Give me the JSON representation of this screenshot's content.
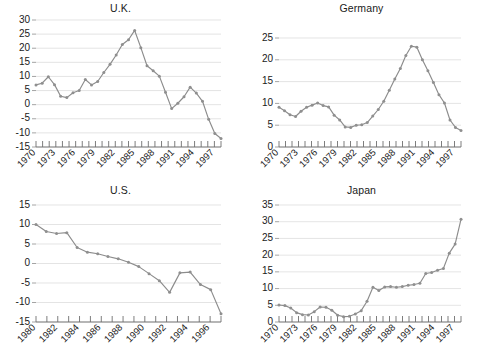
{
  "figure": {
    "layout": "2x2 grid of line charts",
    "panel_order": [
      "uk",
      "germany",
      "us",
      "japan"
    ]
  },
  "style": {
    "line_color": "#8c8c8c",
    "marker_color": "#8f8f8f",
    "grid_color": "#d8d8d8",
    "axis_color": "#7a7a7a",
    "text_color": "#1a1a1a",
    "background": "#ffffff"
  },
  "chart_data": [
    {
      "id": "uk",
      "type": "line",
      "title": "U.K.",
      "xlabel": "",
      "ylabel": "",
      "grid": true,
      "legend": "none",
      "xlim": [
        1970,
        1998
      ],
      "ylim": [
        -15,
        30
      ],
      "ytick_step": 5,
      "yticks": [
        30,
        25,
        20,
        15,
        10,
        5,
        0,
        -5,
        -10,
        -15
      ],
      "ytick_labels": [
        "30",
        "25",
        "20",
        "15",
        "10",
        "5",
        "0",
        "-5",
        "-10",
        "-15"
      ],
      "xticks": [
        1970,
        1971,
        1972,
        1973,
        1974,
        1975,
        1976,
        1977,
        1978,
        1979,
        1980,
        1981,
        1982,
        1983,
        1984,
        1985,
        1986,
        1987,
        1988,
        1989,
        1990,
        1991,
        1992,
        1993,
        1994,
        1995,
        1996,
        1997,
        1998
      ],
      "xtick_labels": [
        "1970",
        "1973",
        "1976",
        "1979",
        "1982",
        "1985",
        "1988",
        "1991",
        "1994",
        "1997"
      ],
      "xtick_label_years": [
        1970,
        1973,
        1976,
        1979,
        1982,
        1985,
        1988,
        1991,
        1994,
        1997
      ],
      "xtick_label_rotation": 45,
      "x": [
        1970,
        1971,
        1972,
        1973,
        1974,
        1975,
        1976,
        1977,
        1978,
        1979,
        1980,
        1981,
        1982,
        1983,
        1984,
        1985,
        1986,
        1987,
        1988,
        1989,
        1990,
        1991,
        1992,
        1993,
        1994,
        1995,
        1996,
        1997,
        1998
      ],
      "values": [
        7.0,
        7.6,
        9.9,
        7.1,
        3.0,
        2.5,
        4.2,
        5.0,
        8.9,
        7.0,
        8.2,
        11.4,
        14.3,
        17.6,
        21.3,
        23.0,
        26.3,
        20.2,
        13.8,
        12.0,
        10.1,
        4.4,
        -1.4,
        0.5,
        2.8,
        6.2,
        4.1,
        1.2,
        -5.2,
        -10.2,
        -12.0
      ]
    },
    {
      "id": "germany",
      "type": "line",
      "title": "Germany",
      "xlabel": "",
      "ylabel": "",
      "grid": true,
      "legend": "none",
      "xlim": [
        1970,
        1998
      ],
      "ylim": [
        0,
        25
      ],
      "ytick_step": 5,
      "yticks": [
        25,
        20,
        15,
        10,
        5,
        0
      ],
      "ytick_labels": [
        "25",
        "20",
        "15",
        "10",
        "5",
        "0"
      ],
      "xticks": [
        1970,
        1971,
        1972,
        1973,
        1974,
        1975,
        1976,
        1977,
        1978,
        1979,
        1980,
        1981,
        1982,
        1983,
        1984,
        1985,
        1986,
        1987,
        1988,
        1989,
        1990,
        1991,
        1992,
        1993,
        1994,
        1995,
        1996,
        1997,
        1998
      ],
      "xtick_labels": [
        "1970",
        "1973",
        "1976",
        "1979",
        "1982",
        "1985",
        "1988",
        "1991",
        "1994",
        "1997"
      ],
      "xtick_label_years": [
        1970,
        1973,
        1976,
        1979,
        1982,
        1985,
        1988,
        1991,
        1994,
        1997
      ],
      "xtick_label_rotation": 45,
      "x": [
        1970,
        1971,
        1972,
        1973,
        1974,
        1975,
        1976,
        1977,
        1978,
        1979,
        1980,
        1981,
        1982,
        1983,
        1984,
        1985,
        1986,
        1987,
        1988,
        1989,
        1990,
        1991,
        1992,
        1993,
        1994,
        1995,
        1996,
        1997,
        1998
      ],
      "values": [
        9.1,
        8.3,
        7.4,
        7.0,
        8.2,
        9.1,
        9.6,
        10.1,
        9.5,
        9.2,
        7.3,
        6.2,
        4.6,
        4.5,
        5.0,
        5.1,
        5.6,
        7.1,
        8.6,
        10.5,
        13.0,
        15.6,
        18.0,
        21.0,
        23.1,
        22.9,
        20.0,
        17.5,
        14.8,
        12.0,
        10.1,
        6.2,
        4.5,
        3.8
      ]
    },
    {
      "id": "us",
      "type": "line",
      "title": "U.S.",
      "xlabel": "",
      "ylabel": "",
      "grid": true,
      "legend": "none",
      "xlim": [
        1980,
        1997
      ],
      "ylim": [
        -15,
        15
      ],
      "ytick_step": 5,
      "yticks": [
        15,
        10,
        5,
        0,
        -5,
        -10,
        -15
      ],
      "ytick_labels": [
        "15",
        "10",
        "5",
        "0",
        "-5",
        "-10",
        "-15"
      ],
      "xticks": [
        1980,
        1981,
        1982,
        1983,
        1984,
        1985,
        1986,
        1987,
        1988,
        1989,
        1990,
        1991,
        1992,
        1993,
        1994,
        1995,
        1996,
        1997
      ],
      "xtick_labels": [
        "1980",
        "1982",
        "1984",
        "1986",
        "1988",
        "1990",
        "1992",
        "1994",
        "1996"
      ],
      "xtick_label_years": [
        1980,
        1982,
        1984,
        1986,
        1988,
        1990,
        1992,
        1994,
        1996
      ],
      "xtick_label_rotation": 45,
      "x": [
        1980,
        1981,
        1982,
        1983,
        1984,
        1985,
        1986,
        1987,
        1988,
        1989,
        1990,
        1991,
        1992,
        1993,
        1994,
        1995,
        1996,
        1997
      ],
      "values": [
        10.0,
        8.2,
        7.7,
        7.9,
        4.1,
        2.9,
        2.5,
        1.8,
        1.2,
        0.3,
        -0.8,
        -2.6,
        -4.4,
        -7.4,
        -2.4,
        -2.2,
        -5.4,
        -6.7,
        -12.9
      ]
    },
    {
      "id": "japan",
      "type": "line",
      "title": "Japan",
      "xlabel": "",
      "ylabel": "",
      "grid": true,
      "legend": "none",
      "xlim": [
        1970,
        1998
      ],
      "ylim": [
        0,
        35
      ],
      "ytick_step": 5,
      "yticks": [
        35,
        30,
        25,
        20,
        15,
        10,
        5,
        0
      ],
      "ytick_labels": [
        "35",
        "30",
        "25",
        "20",
        "15",
        "10",
        "5",
        "0"
      ],
      "xticks": [
        1970,
        1971,
        1972,
        1973,
        1974,
        1975,
        1976,
        1977,
        1978,
        1979,
        1980,
        1981,
        1982,
        1983,
        1984,
        1985,
        1986,
        1987,
        1988,
        1989,
        1990,
        1991,
        1992,
        1993,
        1994,
        1995,
        1996,
        1997,
        1998
      ],
      "xtick_labels": [
        "1970",
        "1973",
        "1976",
        "1979",
        "1982",
        "1985",
        "1988",
        "1991",
        "1994",
        "1997"
      ],
      "xtick_label_years": [
        1970,
        1973,
        1976,
        1979,
        1982,
        1985,
        1988,
        1991,
        1994,
        1997
      ],
      "xtick_label_rotation": 45,
      "x": [
        1970,
        1971,
        1972,
        1973,
        1974,
        1975,
        1976,
        1977,
        1978,
        1979,
        1980,
        1981,
        1982,
        1983,
        1984,
        1985,
        1986,
        1987,
        1988,
        1989,
        1990,
        1991,
        1992,
        1993,
        1994,
        1995,
        1996,
        1997,
        1998
      ],
      "values": [
        5.1,
        4.9,
        4.2,
        2.8,
        2.2,
        2.1,
        3.1,
        4.5,
        4.4,
        3.5,
        2.0,
        1.6,
        1.7,
        2.4,
        3.4,
        6.2,
        10.4,
        9.4,
        10.5,
        10.6,
        10.4,
        10.6,
        11.0,
        11.2,
        11.6,
        14.5,
        14.8,
        15.5,
        16.0,
        20.6,
        23.3,
        30.7
      ]
    }
  ]
}
